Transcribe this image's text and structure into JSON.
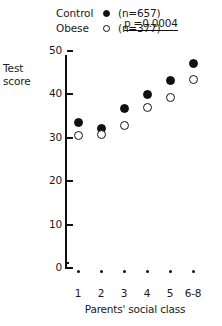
{
  "legend": {
    "entries": [
      {
        "label": "Control",
        "marker": "filled-circle-icon",
        "n_text": "(n=657)"
      },
      {
        "label": "Obese",
        "marker": "open-circle-icon",
        "n_text": "(n=377)"
      }
    ],
    "pvalue_text": "p =0.0004"
  },
  "axes": {
    "y_title_line1": "Test",
    "y_title_line2": "score",
    "x_title": "Parents' social class"
  },
  "chart_data": {
    "type": "scatter",
    "title": "",
    "xlabel": "Parents' social class",
    "ylabel": "Test score",
    "categories": [
      "1",
      "2",
      "3",
      "4",
      "5",
      "6-8"
    ],
    "ylim": [
      0,
      50
    ],
    "yticks": [
      0,
      10,
      20,
      30,
      40,
      50
    ],
    "ytick_labels": [
      "0",
      "10",
      "20",
      "30",
      "40",
      "50"
    ],
    "grid": false,
    "legend_position": "top",
    "annotations": [
      "p =0.0004"
    ],
    "series": [
      {
        "name": "Control",
        "marker": "filled-circle",
        "n": 657,
        "n_text": "(n=657)",
        "values": [
          33.4,
          32.0,
          36.6,
          40.0,
          43.0,
          47.1
        ]
      },
      {
        "name": "Obese",
        "marker": "open-circle",
        "n": 377,
        "n_text": "(n=377)",
        "values": [
          30.4,
          30.7,
          32.7,
          36.8,
          39.3,
          43.4
        ]
      }
    ]
  },
  "colors": {
    "ink": "#111111",
    "background": "#ffffff"
  }
}
